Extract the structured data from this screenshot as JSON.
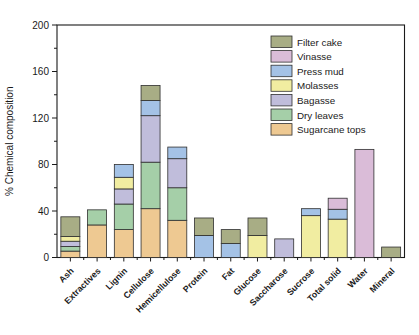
{
  "figure": {
    "ylabel": "% Chemical composition",
    "background_color": "#ffffff",
    "axis_color": "#1a1a1a",
    "bar_border_color": "#2f2f2f"
  },
  "chart_data": {
    "type": "bar",
    "stacked": true,
    "title": "",
    "xlabel": "",
    "ylabel": "% Chemical composition",
    "ylim": [
      0,
      200
    ],
    "yticks": [
      0,
      40,
      80,
      120,
      160,
      200
    ],
    "ytick_minor_step": 20,
    "grid": false,
    "legend_position": "top-right",
    "legend_order_top_to_bottom": [
      "Filter cake",
      "Vinasse",
      "Press mud",
      "Molasses",
      "Bagasse",
      "Dry leaves",
      "Sugarcane tops"
    ],
    "categories": [
      "Ash",
      "Extractives",
      "Lignin",
      "Cellulose",
      "Hemicellulose",
      "Protein",
      "Fat",
      "Glucose",
      "Saccharose",
      "Sucrose",
      "Total solid",
      "Water",
      "Mineral"
    ],
    "series": [
      {
        "name": "Sugarcane tops",
        "color": "#eec992",
        "values": [
          5.5,
          28,
          24,
          42,
          32,
          0,
          0,
          0,
          0,
          0,
          0,
          0,
          0
        ]
      },
      {
        "name": "Dry leaves",
        "color": "#a5cfa8",
        "values": [
          4,
          13,
          22,
          40,
          28,
          0,
          0,
          0,
          0,
          0,
          0,
          0,
          0
        ]
      },
      {
        "name": "Bagasse",
        "color": "#c0bddb",
        "values": [
          4.5,
          0,
          13,
          40,
          25,
          0,
          0,
          0,
          16,
          0,
          0,
          0,
          0
        ]
      },
      {
        "name": "Molasses",
        "color": "#f1eda1",
        "values": [
          4,
          0,
          10,
          0,
          0,
          0,
          0,
          19,
          0,
          36,
          33,
          0,
          0
        ]
      },
      {
        "name": "Press mud",
        "color": "#a4c2e6",
        "values": [
          0,
          0,
          11,
          13,
          10,
          19,
          12,
          0,
          0,
          6,
          8.5,
          0,
          0
        ]
      },
      {
        "name": "Vinasse",
        "color": "#dabcd8",
        "values": [
          0,
          0,
          0,
          0,
          0,
          0,
          0,
          0,
          0,
          0,
          9.5,
          93,
          0
        ]
      },
      {
        "name": "Filter cake",
        "color": "#a8ad85",
        "values": [
          17,
          0,
          0,
          13,
          0,
          15,
          12,
          15,
          0,
          0,
          0,
          0,
          9
        ]
      }
    ],
    "category_totals": [
      35,
      41,
      80,
      148,
      95,
      34,
      24,
      34,
      16,
      42,
      51,
      93,
      9
    ]
  }
}
